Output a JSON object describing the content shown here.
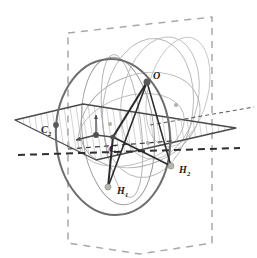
{
  "figure": {
    "background_color": "#ffffff",
    "width": 257,
    "height": 258,
    "colors": {
      "dark_outline": "#4a4a4a",
      "mid_gray": "#8c8c8c",
      "light_gray": "#b8b8b8",
      "very_light_gray": "#c9c9c9",
      "hatch": "#9a9a9a",
      "solid_black": "#2b2b2b",
      "point_dark": "#555555",
      "point_light": "#b5b5ad",
      "dashed_frame": "#a8a8a8"
    },
    "labels": [
      {
        "id": "label-O",
        "text": "O",
        "sub": "",
        "x": 150,
        "y": 78,
        "point_x": 147,
        "point_y": 82
      },
      {
        "id": "label-C1",
        "text": "C",
        "sub": "1",
        "x": 113,
        "y": 151,
        "point_x": 113,
        "point_y": 137
      },
      {
        "id": "label-C2",
        "text": "C",
        "sub": "2",
        "x": 45,
        "y": 131,
        "point_x": 56,
        "point_y": 125
      },
      {
        "id": "label-H1",
        "text": "H",
        "sub": "1",
        "x": 119,
        "y": 192,
        "point_x": 108,
        "point_y": 187
      },
      {
        "id": "label-H2",
        "text": "H",
        "sub": "2",
        "x": 181,
        "y": 172,
        "point_x": 171,
        "point_y": 166
      }
    ],
    "points": [
      {
        "id": "point-O",
        "label": "O",
        "x": 147,
        "y": 82,
        "r": 3.4,
        "fill": "#5a5a5a",
        "kind": "dark"
      },
      {
        "id": "point-C1",
        "label": "C1",
        "x": 113,
        "y": 137,
        "r": 2.6,
        "fill": "#4f4f4f",
        "kind": "dark"
      },
      {
        "id": "point-C2",
        "label": "C2",
        "x": 56,
        "y": 125,
        "r": 2.8,
        "fill": "#5a5a5a",
        "kind": "dark"
      },
      {
        "id": "point-H1",
        "label": "H1",
        "x": 108,
        "y": 187,
        "r": 3.0,
        "fill": "#b8b5ab",
        "kind": "light"
      },
      {
        "id": "point-H2",
        "label": "H2",
        "x": 171,
        "y": 166,
        "r": 3.0,
        "fill": "#b8b5ab",
        "kind": "light"
      },
      {
        "id": "point-origin",
        "label": "",
        "x": 96,
        "y": 135,
        "r": 2.8,
        "fill": "#4f4f4f",
        "kind": "dark"
      },
      {
        "id": "point-aux-1",
        "label": "",
        "x": 176,
        "y": 105,
        "r": 2.2,
        "fill": "#b0b0a8",
        "kind": "light"
      },
      {
        "id": "point-aux-2",
        "label": "",
        "x": 110,
        "y": 124,
        "r": 2.0,
        "fill": "#b0b0a8",
        "kind": "light"
      },
      {
        "id": "point-aux-3",
        "label": "",
        "x": 148,
        "y": 143,
        "r": 2.0,
        "fill": "#b0b0a8",
        "kind": "light"
      }
    ],
    "segments": [
      {
        "id": "segment-O-C1",
        "from": "O",
        "to": "C1",
        "style": "solid-thick"
      },
      {
        "id": "segment-O-H1",
        "from": "O",
        "to": "H1",
        "style": "solid-thick"
      },
      {
        "id": "segment-O-H2",
        "from": "O",
        "to": "H2",
        "style": "solid-thick"
      },
      {
        "id": "segment-C1-H1",
        "from": "C1",
        "to": "H1",
        "style": "solid-thick"
      },
      {
        "id": "segment-C1-H2",
        "from": "C1",
        "to": "H2",
        "style": "solid-thick"
      }
    ],
    "hatched_plane": {
      "id": "hatched-plane",
      "description": "horizontal reference plane drawn as a flattened parallelogram filled with vertical hatch lines",
      "vertices": [
        [
          15,
          120
        ],
        [
          83,
          104
        ],
        [
          236,
          128
        ],
        [
          96,
          160
        ]
      ],
      "hatch_spacing": 6
    },
    "dashed_frame": {
      "id": "dashed-vertical-plane",
      "description": "vertical plane indicated by a dashed quadrilateral outline",
      "vertices": [
        [
          68,
          33
        ],
        [
          212,
          17
        ],
        [
          212,
          243
        ],
        [
          140,
          254
        ],
        [
          68,
          243
        ]
      ]
    },
    "axis_triad": {
      "id": "coordinate-axis-triad",
      "origin": [
        96,
        135
      ],
      "arrows": [
        {
          "id": "axis-up",
          "dx": 0,
          "dy": -22
        },
        {
          "id": "axis-left",
          "dx": -21,
          "dy": 6
        },
        {
          "id": "axis-right",
          "dx": 18,
          "dy": 2
        }
      ]
    },
    "circles": [
      {
        "id": "circle-main-dark",
        "cx": 113,
        "cy": 137,
        "rx": 57,
        "ry": 78,
        "rot": -4,
        "stroke": "#6d6d6d",
        "width": 1.9
      },
      {
        "id": "circle-inner-1",
        "cx": 118,
        "cy": 131,
        "rx": 36,
        "ry": 74,
        "rot": -6,
        "stroke": "#9e9e9e",
        "width": 1.0
      },
      {
        "id": "circle-inner-2",
        "cx": 122,
        "cy": 126,
        "rx": 19,
        "ry": 72,
        "rot": -7,
        "stroke": "#b0b0b0",
        "width": 0.9
      },
      {
        "id": "circle-through-O-1",
        "cx": 148,
        "cy": 108,
        "rx": 45,
        "ry": 70,
        "rot": 8,
        "stroke": "#b5b5b5",
        "width": 0.9
      },
      {
        "id": "circle-through-O-2",
        "cx": 160,
        "cy": 98,
        "rx": 38,
        "ry": 62,
        "rot": 12,
        "stroke": "#bcbcbc",
        "width": 0.9
      },
      {
        "id": "circle-right-1",
        "cx": 178,
        "cy": 92,
        "rx": 30,
        "ry": 56,
        "rot": 14,
        "stroke": "#c2c2c2",
        "width": 0.9
      },
      {
        "id": "circle-slanted-1",
        "cx": 140,
        "cy": 120,
        "rx": 62,
        "ry": 45,
        "rot": -22,
        "stroke": "#b4b4b4",
        "width": 0.9
      },
      {
        "id": "circle-slanted-2",
        "cx": 131,
        "cy": 130,
        "rx": 55,
        "ry": 34,
        "rot": -18,
        "stroke": "#bdbdbd",
        "width": 0.9
      }
    ],
    "dashed_lines": [
      {
        "id": "dashed-axis-main",
        "x1": 18,
        "y1": 155,
        "x2": 240,
        "y2": 148,
        "style": "heavy-dashed",
        "stroke": "#2f2f2f",
        "width": 1.9,
        "dash": "7 5"
      },
      {
        "id": "dotted-line-right",
        "x1": 152,
        "y1": 124,
        "x2": 252,
        "y2": 107,
        "style": "fine-dashed",
        "stroke": "#606060",
        "width": 1.1,
        "dash": "4 3"
      },
      {
        "id": "dashed-chord-C1",
        "x1": 68,
        "y1": 148,
        "x2": 170,
        "y2": 141,
        "style": "fine-dashed",
        "stroke": "#3a3a3a",
        "width": 1.2,
        "dash": "5 4"
      }
    ]
  }
}
